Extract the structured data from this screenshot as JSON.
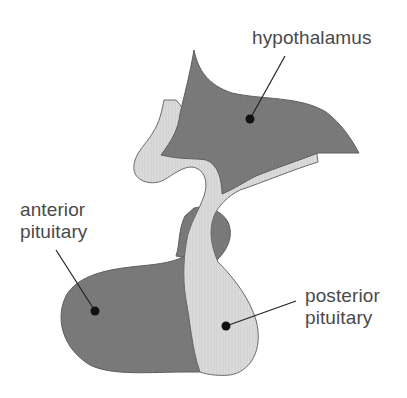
{
  "diagram": {
    "colors": {
      "dark_tissue": "#7a7a7a",
      "light_tissue": "#d9d9d9",
      "outline": "#5e5e5e",
      "leader": "#222222",
      "text": "#4a4a4a",
      "background": "#ffffff"
    },
    "labels": {
      "hypothalamus": {
        "text": "hypothalamus"
      },
      "anterior": {
        "line1": "anterior",
        "line2": "pituitary"
      },
      "posterior": {
        "line1": "posterior",
        "line2": "pituitary"
      }
    },
    "regions": [
      {
        "id": "hypothalamus",
        "fill": "dark"
      },
      {
        "id": "infundibulum-stalk",
        "fill": "light"
      },
      {
        "id": "anterior-pituitary",
        "fill": "dark"
      },
      {
        "id": "posterior-pituitary",
        "fill": "light"
      }
    ]
  }
}
